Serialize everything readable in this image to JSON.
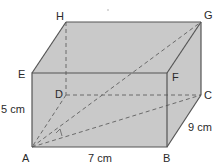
{
  "diagram": {
    "type": "cuboid",
    "colors": {
      "fill": "#c9c9c9",
      "edge": "#555555",
      "hidden_edge": "#6a6a6a",
      "label": "#2a2a2a"
    },
    "vertices": {
      "A": {
        "label": "A"
      },
      "B": {
        "label": "B"
      },
      "C": {
        "label": "C"
      },
      "D": {
        "label": "D"
      },
      "E": {
        "label": "E"
      },
      "F": {
        "label": "F"
      },
      "G": {
        "label": "G"
      },
      "H": {
        "label": "H"
      }
    },
    "dimensions": {
      "height": "5 cm",
      "length": "7 cm",
      "depth": "9 cm"
    },
    "diagonals": [
      "AG",
      "AC"
    ],
    "right_angle_mark": "between AC and CG at A-side"
  }
}
